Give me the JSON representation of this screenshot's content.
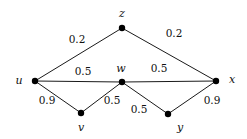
{
  "graph": {
    "nodes": [
      {
        "id": "u",
        "label": "u",
        "x": 35,
        "y": 81,
        "lx": 19,
        "ly": 84
      },
      {
        "id": "z",
        "label": "z",
        "x": 122,
        "y": 28,
        "lx": 122,
        "ly": 17
      },
      {
        "id": "w",
        "label": "w",
        "x": 122,
        "y": 82,
        "lx": 121,
        "ly": 72
      },
      {
        "id": "x",
        "label": "x",
        "x": 216,
        "y": 81,
        "lx": 232,
        "ly": 83
      },
      {
        "id": "v",
        "label": "v",
        "x": 81,
        "y": 113,
        "lx": 81,
        "ly": 131
      },
      {
        "id": "y",
        "label": "y",
        "x": 168,
        "y": 114,
        "lx": 180,
        "ly": 131
      }
    ],
    "edges": [
      {
        "from": "u",
        "to": "z",
        "weight": "0.2",
        "wx": 77,
        "wy": 43
      },
      {
        "from": "z",
        "to": "x",
        "weight": "0.2",
        "wx": 174,
        "wy": 37
      },
      {
        "from": "u",
        "to": "w",
        "weight": "0.5",
        "wx": 83,
        "wy": 75
      },
      {
        "from": "w",
        "to": "x",
        "weight": "0.5",
        "wx": 159,
        "wy": 72
      },
      {
        "from": "u",
        "to": "v",
        "weight": "0.9",
        "wx": 47,
        "wy": 104
      },
      {
        "from": "v",
        "to": "w",
        "weight": "0.5",
        "wx": 112,
        "wy": 104
      },
      {
        "from": "w",
        "to": "y",
        "weight": "0.5",
        "wx": 139,
        "wy": 113
      },
      {
        "from": "y",
        "to": "x",
        "weight": "0.9",
        "wx": 212,
        "wy": 104
      }
    ]
  }
}
